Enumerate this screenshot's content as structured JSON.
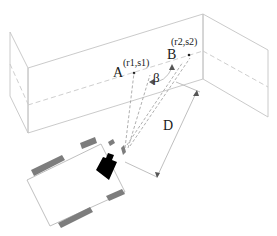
{
  "diagram": {
    "title": "",
    "labels": {
      "point_a": "A",
      "point_a_coord": "(r1,s1)",
      "point_b": "B",
      "point_b_coord": "(r2,s2)",
      "angle": "β",
      "distance": "D"
    },
    "elements": [
      {
        "id": "wall-front",
        "type": "plane",
        "description": "front wall panel with dashed horizontal line"
      },
      {
        "id": "wall-left",
        "type": "plane"
      },
      {
        "id": "wall-right",
        "type": "plane"
      },
      {
        "id": "robot",
        "type": "vehicle",
        "description": "rectangular robot base with four wheels and black camera head"
      },
      {
        "id": "ray-a",
        "type": "sight-line",
        "target": "A"
      },
      {
        "id": "ray-b",
        "type": "sight-line",
        "target": "B"
      },
      {
        "id": "distance-d",
        "type": "dimension",
        "label": "D"
      },
      {
        "id": "angle-beta",
        "type": "angle-arc",
        "label": "β"
      }
    ],
    "colors": {
      "lines": "#c4c4c4",
      "rays": "#9a9a9a",
      "wheels": "#7d7d7d",
      "camera": "#000000",
      "text": "#1a1a1a"
    }
  }
}
